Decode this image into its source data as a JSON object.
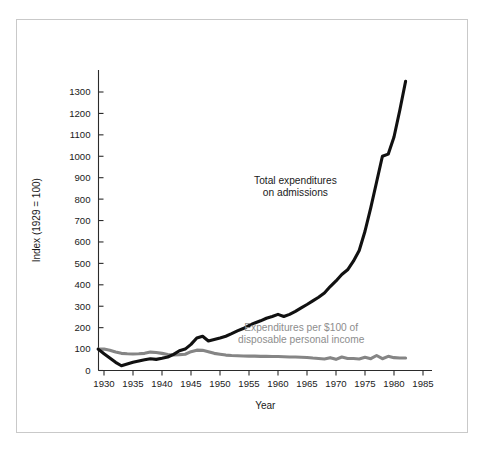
{
  "figure": {
    "background_color": "#ffffff",
    "frame_color": "#c9c9c9"
  },
  "chart_data": {
    "type": "line",
    "title": "",
    "subtitle": "",
    "xlabel": "Year",
    "ylabel": "Index (1929 = 100)",
    "xlim": [
      1928,
      1986
    ],
    "ylim": [
      0,
      1380
    ],
    "xticks": [
      1930,
      1935,
      1940,
      1945,
      1950,
      1955,
      1960,
      1965,
      1970,
      1975,
      1980,
      1985
    ],
    "xtick_labels": [
      "1930",
      "1935",
      "1940",
      "1945",
      "1950",
      "1955",
      "1960",
      "1965",
      "1970",
      "1975",
      "1980",
      "1985"
    ],
    "yticks": [
      0,
      100,
      200,
      300,
      400,
      500,
      600,
      700,
      800,
      900,
      1000,
      1100,
      1200,
      1300
    ],
    "ytick_labels": [
      "0",
      "100",
      "200",
      "300",
      "400",
      "500",
      "600",
      "700",
      "800",
      "900",
      "1000",
      "1100",
      "1200",
      "1300"
    ],
    "grid": false,
    "legend_position": "inline-annotations",
    "series": [
      {
        "name": "Total expenditures on admissions",
        "color": "#111111",
        "label_text_line1": "Total expenditures",
        "label_text_line2": "on admissions",
        "label_x": 1963,
        "label_y": 870,
        "x": [
          1929,
          1930,
          1931,
          1932,
          1933,
          1934,
          1935,
          1936,
          1937,
          1938,
          1939,
          1940,
          1941,
          1942,
          1943,
          1944,
          1945,
          1946,
          1947,
          1948,
          1949,
          1950,
          1951,
          1952,
          1953,
          1954,
          1955,
          1956,
          1957,
          1958,
          1959,
          1960,
          1961,
          1962,
          1963,
          1964,
          1965,
          1966,
          1967,
          1968,
          1969,
          1970,
          1971,
          1972,
          1973,
          1974,
          1975,
          1976,
          1977,
          1978,
          1979,
          1980,
          1981,
          1982
        ],
        "y": [
          100,
          78,
          58,
          38,
          22,
          30,
          38,
          44,
          50,
          55,
          52,
          57,
          63,
          75,
          92,
          100,
          122,
          152,
          160,
          138,
          145,
          152,
          160,
          172,
          185,
          196,
          210,
          222,
          232,
          244,
          252,
          262,
          252,
          262,
          276,
          292,
          308,
          325,
          342,
          362,
          392,
          418,
          448,
          470,
          510,
          560,
          650,
          760,
          880,
          1000,
          1010,
          1090,
          1215,
          1350
        ]
      },
      {
        "name": "Expenditures per $100 of disposable personal income",
        "color": "#858585",
        "label_text_line1": "Expenditures per $100 of",
        "label_text_line2": "disposable personal income",
        "label_x": 1964,
        "label_y": 185,
        "x": [
          1929,
          1930,
          1931,
          1932,
          1933,
          1934,
          1935,
          1936,
          1937,
          1938,
          1939,
          1940,
          1941,
          1942,
          1943,
          1944,
          1945,
          1946,
          1947,
          1948,
          1949,
          1950,
          1951,
          1952,
          1953,
          1954,
          1955,
          1956,
          1957,
          1958,
          1959,
          1960,
          1961,
          1962,
          1963,
          1964,
          1965,
          1966,
          1967,
          1968,
          1969,
          1970,
          1971,
          1972,
          1973,
          1974,
          1975,
          1976,
          1977,
          1978,
          1979,
          1980,
          1981,
          1982
        ],
        "y": [
          100,
          100,
          94,
          86,
          80,
          78,
          77,
          78,
          80,
          86,
          84,
          80,
          75,
          73,
          74,
          76,
          88,
          95,
          94,
          88,
          80,
          76,
          72,
          70,
          69,
          68,
          67,
          67,
          66,
          66,
          65,
          65,
          64,
          63,
          63,
          62,
          61,
          58,
          56,
          54,
          60,
          52,
          63,
          56,
          56,
          54,
          62,
          55,
          70,
          55,
          66,
          60,
          58,
          58
        ]
      }
    ]
  },
  "annotations": {
    "series1_line1": "Total expenditures",
    "series1_line2": "on admissions",
    "series2_line1": "Expenditures per $100 of",
    "series2_line2": "disposable personal income"
  },
  "axes": {
    "x_title": "Year",
    "y_title": "Index (1929 = 100)"
  }
}
